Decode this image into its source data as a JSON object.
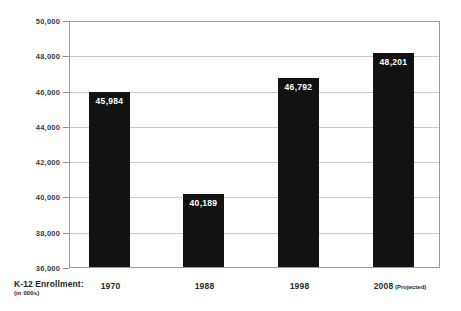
{
  "chart_data": {
    "type": "bar",
    "title": "",
    "subtitle": "",
    "xlabel": "K-12 Enrollment:",
    "xlabel_note": "(in 000s)",
    "ylabel": "",
    "categories": [
      "1970",
      "1988",
      "1998",
      "2008"
    ],
    "category_notes": [
      "",
      "",
      "",
      "(Projected)"
    ],
    "category_display": [
      "1970",
      "1988",
      "1998",
      "2008 (Projected)"
    ],
    "values": [
      45984,
      40189,
      46792,
      48201
    ],
    "value_labels": [
      "45,984",
      "40,189",
      "46,792",
      "48,201"
    ],
    "ylim": [
      36000,
      50000
    ],
    "ytick_values": [
      36000,
      38000,
      40000,
      42000,
      44000,
      46000,
      48000,
      50000
    ],
    "ytick_labels": [
      "36,000",
      "38,000",
      "40,000",
      "42,000",
      "44,000",
      "46,000",
      "48,000",
      "50,000"
    ],
    "ytick_step": 2000,
    "grid": true,
    "grid_axis": "y",
    "legend": false,
    "legend_position": "none",
    "bar_color": "#121212",
    "value_label_color": "#ffffff",
    "grid_color": "#c9c9c9",
    "frame_color": "#9a9a9a",
    "axis_text_color": "#3a3a3a",
    "background_color": "#ffffff"
  }
}
